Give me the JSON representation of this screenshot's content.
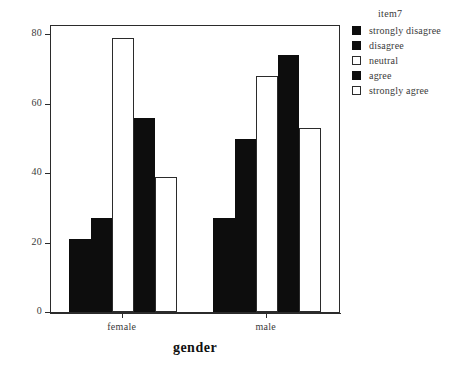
{
  "chart_data": {
    "type": "bar",
    "title": "",
    "xlabel": "gender",
    "ylabel": "Count",
    "categories": [
      "female",
      "male"
    ],
    "series": [
      {
        "name": "strongly disagree",
        "values": [
          21,
          27
        ],
        "fill": "solid"
      },
      {
        "name": "disagree",
        "values": [
          27,
          50
        ],
        "fill": "solid"
      },
      {
        "name": "neutral",
        "values": [
          79,
          68
        ],
        "fill": "open"
      },
      {
        "name": "agree",
        "values": [
          56,
          74
        ],
        "fill": "solid"
      },
      {
        "name": "strongly agree",
        "values": [
          39,
          53
        ],
        "fill": "open"
      }
    ],
    "ylim": [
      0,
      83
    ],
    "yticks": [
      0,
      20,
      40,
      60,
      80
    ],
    "ytick_labels": [
      "0",
      "20",
      "40",
      "60",
      "80"
    ],
    "grid": false,
    "legend_title": "item7",
    "legend_position": "right",
    "colors": {
      "solid": "#0d0d0d",
      "open": "#ffffff",
      "outline": "#2b2b2b",
      "text": "#3a3a3a"
    }
  },
  "legend": {
    "title": "item7",
    "items": [
      {
        "label": "strongly disagree",
        "fill": "solid"
      },
      {
        "label": "disagree",
        "fill": "solid"
      },
      {
        "label": "neutral",
        "fill": "open"
      },
      {
        "label": "agree",
        "fill": "solid"
      },
      {
        "label": "strongly agree",
        "fill": "open"
      }
    ]
  },
  "axes": {
    "y_title": "Count",
    "x_title": "gender",
    "y_tick_labels": [
      "0",
      "20",
      "40",
      "60",
      "80"
    ],
    "x_tick_labels": [
      "female",
      "male"
    ]
  }
}
